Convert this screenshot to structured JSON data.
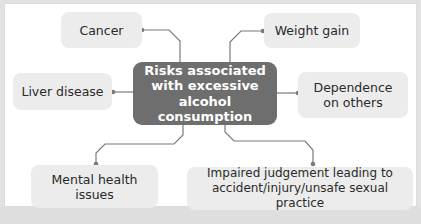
{
  "diagram": {
    "type": "mind-map",
    "center": {
      "line1": "Risks associated",
      "line2": "with excessive",
      "line3": "alcohol consumption"
    },
    "nodes": [
      {
        "id": "cancer",
        "line1": "Cancer"
      },
      {
        "id": "weight-gain",
        "line1": "Weight gain"
      },
      {
        "id": "liver-disease",
        "line1": "Liver disease"
      },
      {
        "id": "dependence",
        "line1": "Dependence",
        "line2": "on others"
      },
      {
        "id": "mental-health",
        "line1": "Mental health",
        "line2": "issues"
      },
      {
        "id": "impaired-judgement",
        "line1": "Impaired judgement leading to",
        "line2": "accident/injury/unsafe sexual practice"
      }
    ],
    "colors": {
      "center_fill": "#6e6e6e",
      "node_fill": "#ececec",
      "connector": "#7a7a7a",
      "frame_bg": "#ffffff",
      "page_bg": "#e2e2e2"
    }
  }
}
